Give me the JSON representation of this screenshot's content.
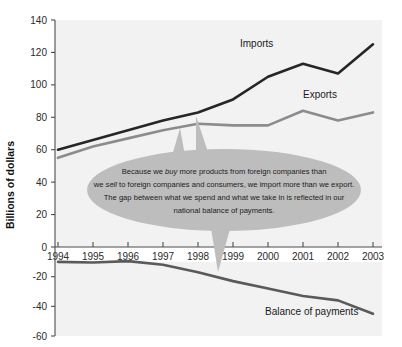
{
  "chart_data": {
    "type": "line",
    "title": "",
    "subtitle": "",
    "xlabel": "",
    "ylabel": "Billions of dollars",
    "grid": false,
    "legend_position": "inline-series-labels",
    "x": [
      1994,
      1995,
      1996,
      1997,
      1998,
      1999,
      2000,
      2001,
      2002,
      2003
    ],
    "categories": [
      "1994",
      "1995",
      "1996",
      "1997",
      "1998",
      "1999",
      "2000",
      "2001",
      "2002",
      "2003"
    ],
    "panels": [
      {
        "name": "upper",
        "ylim": [
          0,
          140
        ],
        "yticks": [
          0,
          20,
          40,
          60,
          80,
          100,
          120,
          140
        ],
        "ytick_labels": [
          "0",
          "20",
          "40",
          "60",
          "80",
          "100",
          "120",
          "140"
        ],
        "series": [
          {
            "name": "Imports",
            "color": "#262626",
            "values": [
              60,
              66,
              72,
              78,
              83,
              91,
              105,
              113,
              107,
              125
            ]
          },
          {
            "name": "Exports",
            "color": "#8c8c8c",
            "values": [
              55,
              62,
              67,
              72,
              76,
              75,
              75,
              84,
              78,
              83
            ]
          }
        ]
      },
      {
        "name": "lower",
        "ylim": [
          -60,
          0
        ],
        "yticks": [
          -60,
          -40,
          -20
        ],
        "ytick_labels": [
          "-60",
          "-40",
          "-20"
        ],
        "series": [
          {
            "name": "Balance of payments",
            "color": "#5a5a5a",
            "values": [
              -10,
              -10.5,
              -9.5,
              -12,
              -17,
              -23,
              -28,
              -33,
              -36,
              -45
            ]
          }
        ]
      }
    ]
  },
  "axis": {
    "y_title": "Billions of dollars",
    "upper_ticks": [
      "140",
      "120",
      "100",
      "80",
      "60",
      "40",
      "20",
      "0"
    ],
    "lower_ticks": [
      "-20",
      "-40",
      "-60"
    ],
    "x_ticks": [
      "1994",
      "1995",
      "1996",
      "1997",
      "1998",
      "1999",
      "2000",
      "2001",
      "2002",
      "2003"
    ]
  },
  "series_labels": {
    "imports": "Imports",
    "exports": "Exports",
    "balance": "Balance of payments"
  },
  "callout": {
    "line1_a": "Because we ",
    "line1_em": "buy",
    "line1_b": " more products from foreign companies than",
    "line2_a": "we ",
    "line2_em": "sell",
    "line2_b": " to foreign companies and consumers, we import more than we export.",
    "line3": "The gap between what we spend and what we take in is reflected in our",
    "line4": "national balance of payments."
  },
  "colors": {
    "imports": "#262626",
    "exports": "#8c8c8c",
    "balance": "#5a5a5a",
    "plot_bg": "#f2f2f2",
    "callout_fill": "#bdbdbd",
    "axis": "#4d4d4d"
  }
}
